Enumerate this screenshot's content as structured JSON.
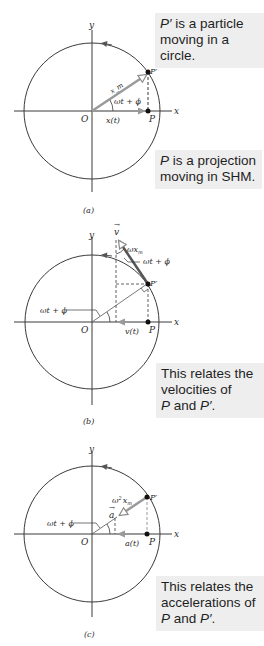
{
  "panels": [
    {
      "id": "a",
      "caption": "(a)",
      "axis_x": "x",
      "axis_y": "y",
      "origin": "O",
      "point": "P",
      "point_prime": "P′",
      "radius_label": "x_m",
      "angle_label": "ωt + ϕ",
      "projection_label": "x(t)",
      "note": {
        "lines": [
          {
            "italic": "P′",
            "text": " is a particle"
          },
          {
            "italic": "",
            "text": "moving in a circle."
          }
        ]
      },
      "note2": {
        "lines": [
          {
            "italic": "P",
            "text": " is a projection"
          },
          {
            "italic": "",
            "text": "moving in SHM."
          }
        ]
      }
    },
    {
      "id": "b",
      "caption": "(b)",
      "axis_x": "x",
      "axis_y": "y",
      "origin": "O",
      "point": "P",
      "point_prime": "P′",
      "vector_label": "v",
      "magnitude_label": "ωx",
      "magnitude_sub": "m",
      "angle_label_top": "ωt + ϕ",
      "angle_label_left": "ωt + ϕ",
      "projection_label": "v(t)",
      "note": {
        "lines": [
          {
            "italic": "",
            "text": "This relates the"
          },
          {
            "italic": "",
            "text": "velocities of"
          },
          {
            "italic": "P",
            "text": " and ",
            "italic2": "P′",
            "tail": "."
          }
        ]
      }
    },
    {
      "id": "c",
      "caption": "(c)",
      "axis_x": "x",
      "axis_y": "y",
      "origin": "O",
      "point": "P",
      "point_prime": "P′",
      "vector_label": "a",
      "magnitude_label": "ω",
      "magnitude_sup": "2",
      "magnitude_x": "x",
      "magnitude_sub": "m",
      "angle_label_left": "ωt + ϕ",
      "projection_label": "a(t)",
      "note": {
        "lines": [
          {
            "italic": "",
            "text": "This relates the"
          },
          {
            "italic": "",
            "text": "accelerations of"
          },
          {
            "italic": "P",
            "text": " and ",
            "italic2": "P′",
            "tail": "."
          }
        ]
      }
    }
  ],
  "colors": {
    "line": "#3a3a3a",
    "vector": "#9a9a9a",
    "note_bg": "#eeeeee"
  }
}
